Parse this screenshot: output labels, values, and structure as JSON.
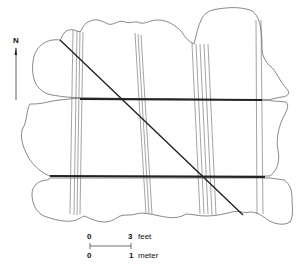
{
  "figure": {
    "north_label": "N",
    "scale_bar": {
      "top_left": "0",
      "top_right": "3",
      "top_unit": "feet",
      "bottom_left": "0",
      "bottom_right": "1",
      "bottom_unit": "meter"
    }
  },
  "colors": {
    "line": "#555555",
    "rope": "#222222",
    "background": "#ffffff"
  }
}
